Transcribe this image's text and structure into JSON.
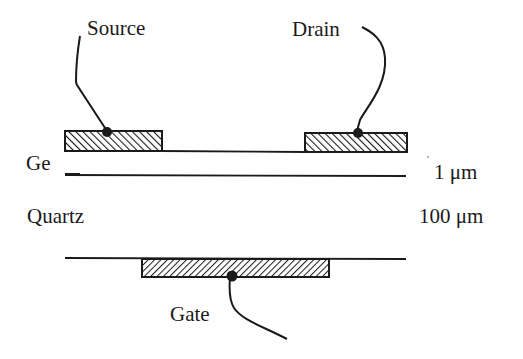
{
  "diagram": {
    "type": "device cross-section",
    "colors": {
      "ink": "#1a1a1a",
      "background": "#ffffff"
    },
    "labels": {
      "source": "Source",
      "drain": "Drain",
      "gate": "Gate",
      "ge_layer": "Ge",
      "quartz_layer": "Quartz",
      "ge_thickness": "1 μm",
      "quartz_thickness": "100 μm"
    },
    "layers": [
      {
        "name": "Ge",
        "thickness": "1 μm"
      },
      {
        "name": "Quartz",
        "thickness": "100 μm"
      }
    ],
    "contacts": [
      {
        "name": "Source",
        "position": "top-left",
        "hatch": "back-diagonal"
      },
      {
        "name": "Drain",
        "position": "top-right",
        "hatch": "back-diagonal"
      },
      {
        "name": "Gate",
        "position": "bottom-center",
        "hatch": "forward-diagonal"
      }
    ]
  }
}
